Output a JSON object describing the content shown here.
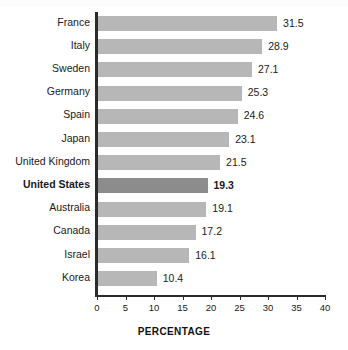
{
  "chart_data": {
    "type": "bar",
    "orientation": "horizontal",
    "title": "",
    "xlabel": "PERCENTAGE",
    "ylabel": "",
    "categories": [
      "France",
      "Italy",
      "Sweden",
      "Germany",
      "Spain",
      "Japan",
      "United Kingdom",
      "United States",
      "Australia",
      "Canada",
      "Israel",
      "Korea"
    ],
    "values": [
      31.5,
      28.9,
      27.1,
      25.3,
      24.6,
      23.1,
      21.5,
      19.3,
      19.1,
      17.2,
      16.1,
      10.4
    ],
    "value_labels": [
      "31.5",
      "28.9",
      "27.1",
      "25.3",
      "24.6",
      "23.1",
      "21.5",
      "19.3",
      "19.1",
      "17.2",
      "16.1",
      "10.4"
    ],
    "highlighted_category": "United States",
    "xlim": [
      0,
      40
    ],
    "xticks": [
      0,
      5,
      10,
      15,
      20,
      25,
      30,
      35,
      40
    ],
    "xtick_labels": [
      "0",
      "5",
      "10",
      "15",
      "20",
      "25",
      "30",
      "35",
      "40"
    ],
    "grid": false,
    "legend": null,
    "colors": {
      "bar": "#b7b7b7",
      "bar_highlight": "#8c8c8c",
      "axis": "#2b2b2b",
      "text": "#1a1a1a",
      "background": "#ffffff"
    }
  }
}
